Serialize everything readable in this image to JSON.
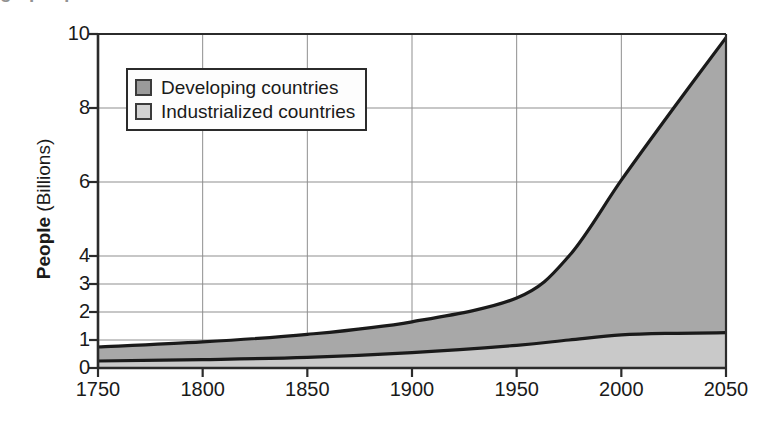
{
  "figure": {
    "top_cut_text": "g p q",
    "axis_color": "#2b2b2b",
    "grid_color": "#8f8f8f"
  },
  "legend": {
    "position": "inside-top-left",
    "items": [
      {
        "label": "Developing countries",
        "swatch_color": "#9a9a9a",
        "name": "developing"
      },
      {
        "label": "Industrialized countries",
        "swatch_color": "#d2d2d2",
        "name": "industrialized"
      }
    ]
  },
  "chart_data": {
    "type": "area",
    "stacked": true,
    "title": "",
    "subtitle": "",
    "xlabel": "",
    "ylabel": "People (Billions)",
    "ylabel_parts": {
      "bold": "People",
      "regular": " (Billions)"
    },
    "xlim": [
      1750,
      2050
    ],
    "ylim": [
      0,
      10
    ],
    "grid": true,
    "grid_axes": "both",
    "xticks": [
      1750,
      1800,
      1850,
      1900,
      1950,
      2000,
      2050
    ],
    "xticklabels": [
      "1750",
      "1800",
      "1850",
      "1900",
      "1950",
      "2000",
      "2050"
    ],
    "yticks": [
      0,
      1,
      2,
      3,
      4,
      6,
      8,
      10
    ],
    "yticklabels": [
      "0",
      "1",
      "2",
      "3",
      "4",
      "6",
      "8",
      "10"
    ],
    "y_axis_scale": "piecewise-linear (0-4 expanded, 4-10 compressed)",
    "x": [
      1750,
      1800,
      1850,
      1900,
      1950,
      1975,
      2000,
      2025,
      2050
    ],
    "series": [
      {
        "name": "Industrialized countries",
        "fill_color": "#c9c9c9",
        "line_color": "#1a1a1a",
        "values": [
          0.25,
          0.3,
          0.38,
          0.55,
          0.81,
          1.0,
          1.18,
          1.24,
          1.26
        ]
      },
      {
        "name": "Developing countries",
        "fill_color": "#a8a8a8",
        "line_color": "#1a1a1a",
        "values": [
          0.5,
          0.63,
          0.82,
          1.1,
          1.69,
          3.0,
          4.87,
          6.76,
          8.64
        ]
      }
    ],
    "totals": {
      "name": "World total",
      "values": [
        0.75,
        0.93,
        1.2,
        1.65,
        2.5,
        4.0,
        6.05,
        8.0,
        9.9
      ]
    },
    "annotations": []
  }
}
